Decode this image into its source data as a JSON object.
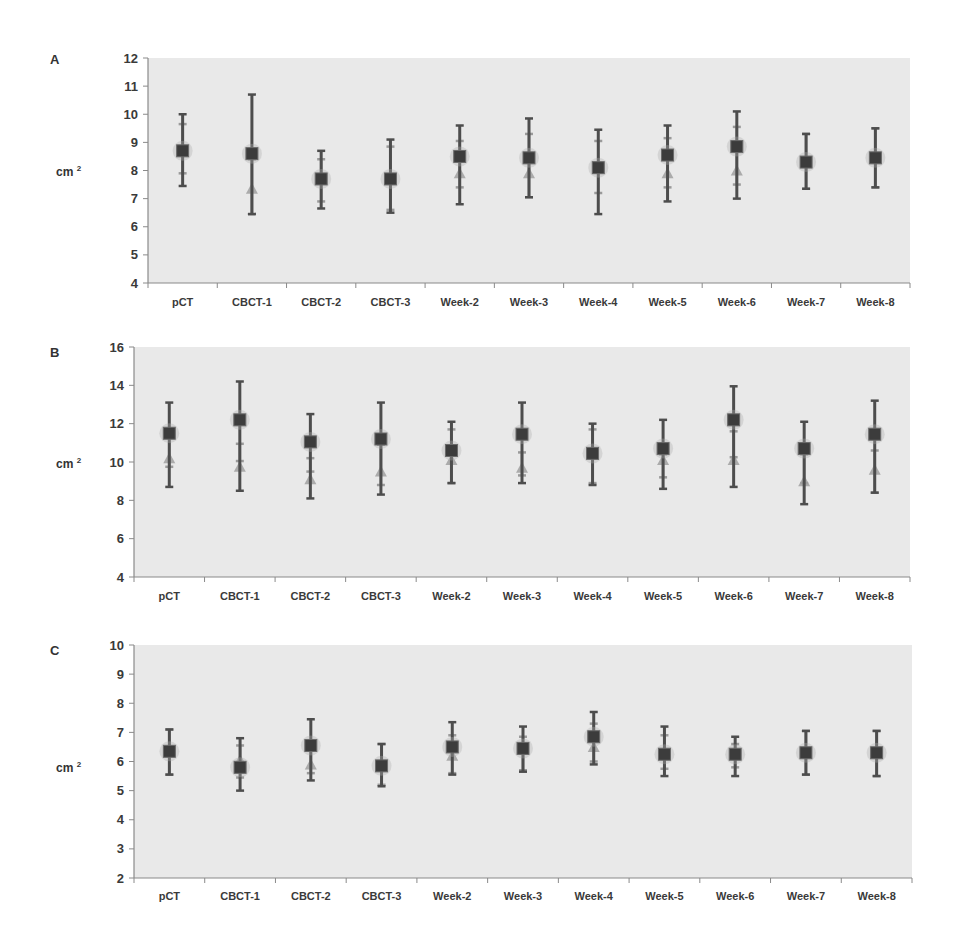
{
  "figure": {
    "panels": [
      {
        "letter": "A",
        "unit": "cm",
        "unit_sup": "2"
      },
      {
        "letter": "B",
        "unit": "cm",
        "unit_sup": "2"
      },
      {
        "letter": "C",
        "unit": "cm",
        "unit_sup": "2"
      }
    ]
  },
  "colors": {
    "plot_bg": "#e9e9e9",
    "axis": "#8a8a8a",
    "primary_series": "#4d4d4d",
    "secondary_series": "#9a9a9a",
    "text": "#3a3a3a"
  },
  "chart_data": [
    {
      "type": "scatter",
      "panel": "A",
      "title": "",
      "xlabel": "",
      "ylabel": "cm 2",
      "ylim": [
        4,
        12
      ],
      "yticks": [
        4,
        5,
        6,
        7,
        8,
        9,
        10,
        11,
        12
      ],
      "grid": false,
      "categories": [
        "pCT",
        "CBCT-1",
        "CBCT-2",
        "CBCT-3",
        "Week-2",
        "Week-3",
        "Week-4",
        "Week-5",
        "Week-6",
        "Week-7",
        "Week-8"
      ],
      "series": [
        {
          "name": "square markers",
          "marker": "square",
          "values": [
            8.7,
            8.6,
            7.7,
            7.7,
            8.5,
            8.45,
            8.1,
            8.55,
            8.85,
            8.3,
            8.45
          ],
          "error_high": [
            10.0,
            10.7,
            8.7,
            9.1,
            9.6,
            9.85,
            9.45,
            9.6,
            10.1,
            9.3,
            9.5
          ],
          "error_low": [
            7.45,
            6.45,
            6.65,
            6.5,
            6.8,
            7.05,
            6.45,
            6.9,
            7.0,
            7.35,
            7.4
          ]
        },
        {
          "name": "triangle markers",
          "marker": "triangle",
          "values": [
            8.7,
            7.35,
            7.7,
            7.7,
            7.9,
            7.9,
            8.05,
            7.9,
            8.0,
            8.3,
            8.45
          ],
          "error_high": [
            9.65,
            8.4,
            8.4,
            8.85,
            9.05,
            9.3,
            9.05,
            9.15,
            9.55,
            9.3,
            9.5
          ],
          "error_low": [
            7.9,
            6.45,
            6.9,
            6.6,
            7.4,
            7.05,
            7.2,
            7.4,
            7.5,
            7.35,
            7.4
          ]
        }
      ]
    },
    {
      "type": "scatter",
      "panel": "B",
      "title": "",
      "xlabel": "",
      "ylabel": "cm 2",
      "ylim": [
        4,
        16
      ],
      "yticks": [
        4,
        6,
        8,
        10,
        12,
        14,
        16
      ],
      "grid": false,
      "categories": [
        "pCT",
        "CBCT-1",
        "CBCT-2",
        "CBCT-3",
        "Week-2",
        "Week-3",
        "Week-4",
        "Week-5",
        "Week-6",
        "Week-7",
        "Week-8"
      ],
      "series": [
        {
          "name": "square markers",
          "marker": "square",
          "values": [
            11.5,
            12.2,
            11.05,
            11.2,
            10.6,
            11.45,
            10.45,
            10.7,
            12.2,
            10.7,
            11.45
          ],
          "error_high": [
            13.1,
            14.2,
            12.5,
            13.1,
            12.1,
            13.1,
            12.0,
            12.2,
            13.95,
            12.1,
            13.2
          ],
          "error_low": [
            8.7,
            8.5,
            8.1,
            8.3,
            8.9,
            8.9,
            8.8,
            8.6,
            8.7,
            7.8,
            8.4
          ]
        },
        {
          "name": "triangle markers",
          "marker": "triangle",
          "values": [
            10.2,
            9.75,
            9.1,
            9.5,
            10.1,
            9.7,
            10.4,
            10.1,
            10.1,
            9.0,
            9.6
          ],
          "error_high": [
            11.7,
            10.95,
            10.2,
            10.9,
            11.7,
            10.5,
            11.7,
            10.4,
            11.6,
            10.4,
            10.6
          ],
          "error_low": [
            9.75,
            10.05,
            9.5,
            8.8,
            8.9,
            9.3,
            8.9,
            9.2,
            10.25,
            8.9,
            8.4
          ]
        }
      ]
    },
    {
      "type": "scatter",
      "panel": "C",
      "title": "",
      "xlabel": "",
      "ylabel": "cm 2",
      "ylim": [
        2,
        10
      ],
      "yticks": [
        2,
        3,
        4,
        5,
        6,
        7,
        8,
        9,
        10
      ],
      "grid": false,
      "categories": [
        "pCT",
        "CBCT-1",
        "CBCT-2",
        "CBCT-3",
        "Week-2",
        "Week-3",
        "Week-4",
        "Week-5",
        "Week-6",
        "Week-7",
        "Week-8"
      ],
      "series": [
        {
          "name": "square markers",
          "marker": "square",
          "values": [
            6.35,
            5.8,
            6.55,
            5.85,
            6.5,
            6.45,
            6.85,
            6.25,
            6.25,
            6.3,
            6.3
          ],
          "error_high": [
            7.1,
            6.8,
            7.45,
            6.6,
            7.35,
            7.2,
            7.7,
            7.2,
            6.85,
            7.05,
            7.05
          ],
          "error_low": [
            5.55,
            5.0,
            5.35,
            5.15,
            5.55,
            5.65,
            5.9,
            5.5,
            5.5,
            5.55,
            5.5
          ]
        },
        {
          "name": "triangle markers",
          "marker": "triangle",
          "values": [
            6.35,
            6.05,
            5.9,
            5.85,
            6.2,
            6.4,
            6.5,
            6.25,
            6.25,
            6.3,
            6.3
          ],
          "error_high": [
            7.1,
            6.55,
            6.6,
            6.6,
            6.9,
            6.85,
            7.3,
            6.9,
            6.6,
            7.05,
            7.05
          ],
          "error_low": [
            5.55,
            5.45,
            5.6,
            5.2,
            5.6,
            5.7,
            6.0,
            5.75,
            5.8,
            5.55,
            5.5
          ]
        }
      ]
    }
  ]
}
